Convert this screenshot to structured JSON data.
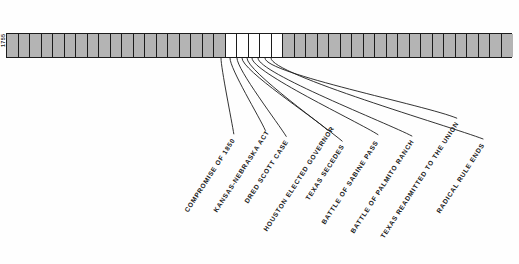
{
  "figure": {
    "type": "timeline",
    "orientation": "horizontal",
    "background_color": "#fefefe",
    "line_color": "#1c1c1c",
    "fill_color": "#b4b4b4",
    "empty_color": "#ffffff"
  },
  "axis": {
    "start_year": 1755,
    "end_year": 1975,
    "tick_interval": 5,
    "tick_labels": [
      "1755",
      "1760",
      "1765",
      "1770",
      "1775",
      "1780",
      "1785",
      "1790",
      "1795",
      "1800",
      "1805",
      "1810",
      "1815",
      "1820",
      "1825",
      "1830",
      "1835",
      "1840",
      "1845",
      "1850",
      "1855",
      "1860",
      "1865",
      "1870",
      "1875",
      "1880",
      "1885",
      "1890",
      "1895",
      "1900",
      "1905",
      "1910",
      "1915",
      "1920",
      "1925",
      "1930",
      "1935",
      "1940",
      "1945",
      "1950",
      "1955",
      "1960",
      "1965",
      "1970",
      "1975"
    ]
  },
  "highlight": {
    "description": "unshaded expanded span",
    "start_year": 1850,
    "end_year": 1875,
    "shaded_segments": [
      {
        "from": 1755,
        "to": 1850
      },
      {
        "from": 1875,
        "to": 1975
      }
    ]
  },
  "events": [
    {
      "label": "COMPROMISE OF 1850",
      "year": 1850,
      "anchor_x": 221,
      "label_x": 186,
      "label_y": 208
    },
    {
      "label": "KANSAS-NEBRASKA ACT",
      "year": 1854,
      "anchor_x": 230,
      "label_x": 215,
      "label_y": 208
    },
    {
      "label": "DRED SCOTT CASE",
      "year": 1857,
      "anchor_x": 237,
      "label_x": 246,
      "label_y": 199
    },
    {
      "label": "HOUSTON ELECTED GOVERNOR",
      "year": 1859,
      "anchor_x": 242,
      "label_x": 265,
      "label_y": 227
    },
    {
      "label": "TEXAS SECEDES",
      "year": 1861,
      "anchor_x": 247,
      "label_x": 307,
      "label_y": 196
    },
    {
      "label": "BATTLE OF SABINE PASS",
      "year": 1863,
      "anchor_x": 252,
      "label_x": 323,
      "label_y": 220
    },
    {
      "label": "BATTLE OF PALMITO RANCH",
      "year": 1865,
      "anchor_x": 258,
      "label_x": 352,
      "label_y": 229
    },
    {
      "label": "TEXAS READMITTED TO THE UNION",
      "year": 1870,
      "anchor_x": 265,
      "label_x": 382,
      "label_y": 234
    },
    {
      "label": "RADICAL RULE ENDS",
      "year": 1874,
      "anchor_x": 271,
      "label_x": 438,
      "label_y": 209
    }
  ]
}
